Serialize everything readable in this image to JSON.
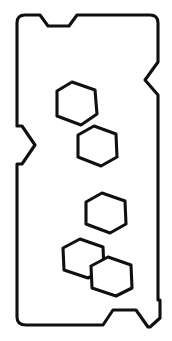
{
  "figure": {
    "type": "technical-line-drawing",
    "background_color": "#ffffff",
    "stroke_color": "#101010",
    "fill_color": "#ffffff",
    "stroke_width": 3.1,
    "canvas": {
      "width": 172,
      "height": 341
    }
  },
  "plate": {
    "name": "outer-plate-outline",
    "corner_radius": 8,
    "bounds": {
      "x_min": 17,
      "y_min": 15,
      "x_max": 160,
      "y_max": 327
    },
    "path": "M 25 15 L 40 15 L 48 26 L 69 26 L 77 15 L 150 15 Q 158 15 158 23 L 158 62 L 145 80 L 158 95 L 158 300 L 160 300 L 160 318 L 150 327 L 148 327 L 136 310 L 113 310 L 103 325 L 26 325 Q 17 325 17 317 L 17 164 L 22 164 L 35 145 L 22 126 L 17 126 L 17 23 Q 17 15 25 15 Z",
    "features": [
      {
        "name": "top-left-rounded-corner",
        "x": 17,
        "y": 15
      },
      {
        "name": "top-notch",
        "x": 40,
        "y": 26,
        "width": 37,
        "depth": 11
      },
      {
        "name": "top-right-rounded-corner",
        "x": 158,
        "y": 15
      },
      {
        "name": "right-v-notch",
        "x": 145,
        "y": 80,
        "depth": 13
      },
      {
        "name": "right-step",
        "x": 160,
        "y": 300
      },
      {
        "name": "bottom-right-chamfer",
        "x": 150,
        "y": 327
      },
      {
        "name": "bottom-notch",
        "x": 113,
        "y": 310,
        "width": 45,
        "depth": 15
      },
      {
        "name": "bottom-left-rounded-corner",
        "x": 17,
        "y": 325
      },
      {
        "name": "left-v-notch",
        "x": 35,
        "y": 145,
        "depth": 18
      }
    ]
  },
  "holes": [
    {
      "name": "hexagon-hole-1",
      "shape": "hexagon",
      "center": {
        "x": 76,
        "y": 103
      },
      "radius": 22,
      "rotation_deg": 8,
      "path": "M 57 91 L 72 82 L 95 90 L 97 114 L 81 125 L 57 116 Z"
    },
    {
      "name": "hexagon-hole-2",
      "shape": "hexagon",
      "center": {
        "x": 97,
        "y": 146
      },
      "radius": 21,
      "rotation_deg": 4,
      "path": "M 78 135 L 94 126 L 116 134 L 117 157 L 101 166 L 78 157 Z"
    },
    {
      "name": "hexagon-hole-3",
      "shape": "hexagon",
      "center": {
        "x": 106,
        "y": 213
      },
      "radius": 21,
      "rotation_deg": 5,
      "path": "M 86 202 L 102 193 L 125 201 L 126 224 L 110 233 L 86 224 Z"
    },
    {
      "name": "hexagon-hole-4",
      "shape": "hexagon",
      "center": {
        "x": 83,
        "y": 258
      },
      "radius": 21,
      "rotation_deg": 6,
      "path": "M 63 248 L 80 239 L 103 247 L 104 270 L 88 278 L 64 270 Z"
    },
    {
      "name": "hexagon-hole-5",
      "shape": "hexagon",
      "center": {
        "x": 111,
        "y": 276
      },
      "radius": 21,
      "rotation_deg": 6,
      "path": "M 91 266 L 108 257 L 131 265 L 132 288 L 116 296 L 92 288 Z"
    }
  ]
}
